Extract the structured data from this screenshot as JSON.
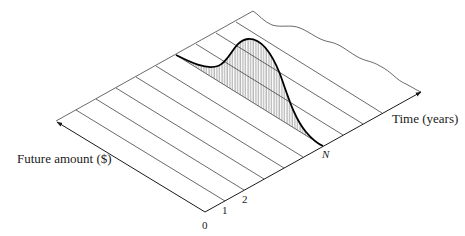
{
  "diagram": {
    "type": "3d-cash-flow-surface",
    "axes": {
      "future_amount": {
        "label": "Future amount ($)"
      },
      "time": {
        "label": "Time (years)"
      }
    },
    "ticks": {
      "origin": "0",
      "t1": "1",
      "t2": "2",
      "tN": "N"
    },
    "curve": {
      "description": "Shaded bell-shaped distribution of future amount at time N",
      "fill": "vertical-hatch"
    },
    "colors": {
      "line": "#1a1a1a",
      "background": "#ffffff"
    }
  }
}
